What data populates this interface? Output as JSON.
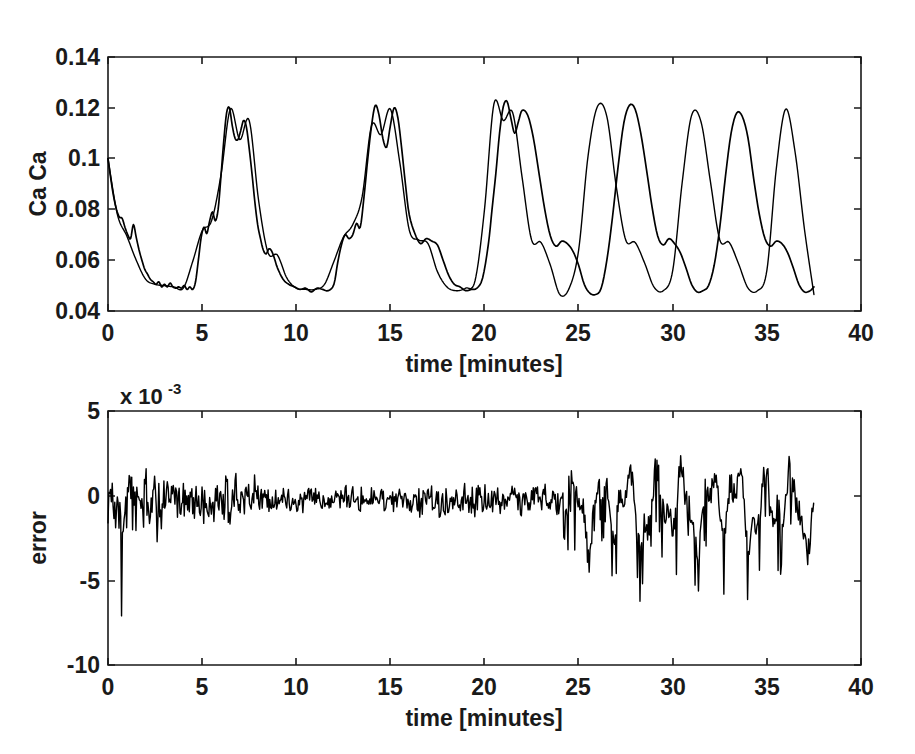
{
  "figure": {
    "background": "#ffffff",
    "line_color": "#000000",
    "axis_color": "#1a1a1a"
  },
  "chart_data": [
    {
      "type": "line",
      "id": "calcium-trace",
      "title": "",
      "xlabel": "time [minutes]",
      "ylabel": "Ca Ca",
      "xlim": [
        0,
        40
      ],
      "ylim": [
        0.04,
        0.14
      ],
      "xticks": [
        0,
        5,
        10,
        15,
        20,
        25,
        30,
        35,
        40
      ],
      "xticklabels": [
        "0",
        "5",
        "10",
        "15",
        "20",
        "25",
        "30",
        "35",
        "40"
      ],
      "yticks": [
        0.04,
        0.06,
        0.08,
        0.1,
        0.12,
        0.14
      ],
      "yticklabels": [
        "0.04",
        "0.06",
        "0.08",
        "0.1",
        "0.12",
        "0.14"
      ],
      "grid": false,
      "legend": false,
      "series": [
        {
          "name": "measured",
          "x": [
            0.0,
            0.15,
            0.3,
            0.45,
            0.6,
            0.75,
            0.9,
            1.05,
            1.2,
            1.35,
            1.5,
            1.65,
            1.8,
            1.95,
            2.1,
            2.25,
            2.4,
            2.55,
            2.7,
            2.85,
            3.0,
            3.15,
            3.3,
            3.45,
            3.6,
            3.75,
            3.9,
            4.05,
            4.2,
            4.35,
            4.5,
            4.65,
            4.8,
            4.95,
            5.1,
            5.25,
            5.4,
            5.55,
            5.7,
            5.85,
            6.0,
            6.15,
            6.3,
            6.45,
            6.6,
            6.75,
            6.9,
            7.05,
            7.2,
            7.35,
            7.5,
            7.65,
            7.8,
            7.95,
            8.1,
            8.25,
            8.4,
            8.55,
            8.7,
            8.85,
            9.0,
            9.3,
            9.6,
            9.9,
            10.2,
            10.5,
            10.8,
            11.1,
            11.4,
            11.7,
            12.0,
            12.2,
            12.4,
            12.6,
            12.8,
            13.0,
            13.2,
            13.4,
            13.6,
            13.8,
            14.0,
            14.2,
            14.4,
            14.6,
            14.8,
            15.0,
            15.2,
            15.4,
            15.6,
            15.8,
            16.0,
            16.3,
            16.6,
            16.9,
            17.2,
            17.5,
            17.8,
            18.1,
            18.4,
            18.7,
            19.0,
            19.3,
            19.6,
            19.9,
            20.2,
            20.4,
            20.6,
            20.8,
            21.0,
            21.2,
            21.4,
            21.6,
            21.8,
            22.0,
            22.3,
            22.6,
            22.9,
            23.2,
            23.5,
            23.8,
            24.1,
            24.4,
            24.7,
            25.0,
            25.3,
            25.6,
            25.9,
            26.2,
            26.5,
            26.8,
            27.1,
            27.4,
            27.7,
            28.0,
            28.3,
            28.6,
            28.9,
            29.2,
            29.5,
            29.8,
            30.1,
            30.4,
            30.7,
            31.0,
            31.3,
            31.6,
            31.9,
            32.2,
            32.5,
            32.8,
            33.1,
            33.4,
            33.7,
            34.0,
            34.3,
            34.6,
            34.9,
            35.2,
            35.5,
            35.8,
            36.1,
            36.4,
            36.7,
            37.0,
            37.3,
            37.5
          ],
          "y": [
            0.1,
            0.092,
            0.085,
            0.08,
            0.077,
            0.0765,
            0.073,
            0.07,
            0.0685,
            0.074,
            0.069,
            0.064,
            0.06,
            0.0565,
            0.0545,
            0.0525,
            0.0515,
            0.0505,
            0.0515,
            0.0495,
            0.0505,
            0.0495,
            0.051,
            0.0495,
            0.049,
            0.0495,
            0.049,
            0.05,
            0.0485,
            0.0495,
            0.0485,
            0.0515,
            0.06,
            0.069,
            0.073,
            0.0705,
            0.0755,
            0.079,
            0.0755,
            0.08,
            0.093,
            0.107,
            0.118,
            0.12,
            0.113,
            0.108,
            0.1075,
            0.111,
            0.115,
            0.1125,
            0.104,
            0.094,
            0.083,
            0.074,
            0.0685,
            0.064,
            0.0625,
            0.0645,
            0.0635,
            0.0605,
            0.057,
            0.0525,
            0.0505,
            0.0495,
            0.0485,
            0.049,
            0.0475,
            0.049,
            0.0485,
            0.048,
            0.0505,
            0.059,
            0.066,
            0.07,
            0.0685,
            0.07,
            0.0745,
            0.073,
            0.085,
            0.1,
            0.113,
            0.121,
            0.117,
            0.108,
            0.1045,
            0.113,
            0.12,
            0.116,
            0.104,
            0.09,
            0.078,
            0.0705,
            0.0665,
            0.0685,
            0.0675,
            0.066,
            0.06,
            0.054,
            0.0505,
            0.0495,
            0.048,
            0.0485,
            0.049,
            0.053,
            0.066,
            0.08,
            0.094,
            0.11,
            0.1205,
            0.1225,
            0.116,
            0.11,
            0.1145,
            0.119,
            0.117,
            0.108,
            0.094,
            0.08,
            0.0695,
            0.0655,
            0.0675,
            0.0665,
            0.0635,
            0.058,
            0.0505,
            0.047,
            0.0465,
            0.049,
            0.06,
            0.077,
            0.097,
            0.114,
            0.121,
            0.1195,
            0.11,
            0.096,
            0.081,
            0.0695,
            0.066,
            0.0685,
            0.0665,
            0.063,
            0.057,
            0.0505,
            0.0475,
            0.048,
            0.05,
            0.058,
            0.073,
            0.093,
            0.11,
            0.118,
            0.1165,
            0.108,
            0.092,
            0.078,
            0.0685,
            0.0655,
            0.0675,
            0.0665,
            0.063,
            0.057,
            0.0505,
            0.0475,
            0.048,
            0.0495,
            0.055,
            0.07,
            0.092,
            0.111,
            0.12,
            0.1215,
            0.118,
            0.107,
            0.092,
            0.078,
            0.0685,
            0.0665,
            0.069,
            0.0655,
            0.06,
            0.054,
            0.0495,
            0.0465,
            0.048,
            0.046
          ]
        },
        {
          "name": "model",
          "x": [
            0.0,
            0.5,
            1.0,
            1.5,
            2.0,
            2.5,
            3.0,
            3.5,
            4.0,
            4.5,
            5.0,
            5.5,
            6.0,
            6.5,
            7.0,
            7.5,
            8.0,
            8.5,
            9.0,
            9.5,
            10.0,
            10.5,
            11.0,
            11.5,
            12.0,
            12.5,
            13.0,
            13.5,
            14.0,
            14.5,
            15.0,
            15.5,
            16.0,
            16.5,
            17.0,
            17.5,
            18.0,
            18.5,
            19.0,
            19.5,
            20.0,
            20.5,
            21.0,
            21.5,
            22.0,
            22.5,
            23.0,
            23.5,
            24.0,
            24.5,
            25.0,
            25.5,
            26.0,
            26.5,
            27.0,
            27.5,
            28.0,
            28.5,
            29.0,
            29.5,
            30.0,
            30.5,
            31.0,
            31.5,
            32.0,
            32.5,
            33.0,
            33.5,
            34.0,
            34.5,
            35.0,
            35.5,
            36.0,
            36.5,
            37.0,
            37.5
          ],
          "y": [
            0.1,
            0.078,
            0.0695,
            0.06,
            0.0525,
            0.0505,
            0.05,
            0.0495,
            0.049,
            0.0595,
            0.0715,
            0.0755,
            0.0935,
            0.1195,
            0.1075,
            0.115,
            0.0835,
            0.063,
            0.062,
            0.053,
            0.049,
            0.0485,
            0.0485,
            0.0505,
            0.0595,
            0.069,
            0.074,
            0.085,
            0.113,
            0.1095,
            0.1195,
            0.0985,
            0.072,
            0.068,
            0.0665,
            0.0555,
            0.0495,
            0.048,
            0.049,
            0.052,
            0.08,
            0.1215,
            0.115,
            0.118,
            0.0925,
            0.068,
            0.067,
            0.058,
            0.0465,
            0.049,
            0.064,
            0.101,
            0.1205,
            0.1165,
            0.089,
            0.068,
            0.067,
            0.059,
            0.0495,
            0.048,
            0.056,
            0.0905,
            0.117,
            0.1145,
            0.091,
            0.068,
            0.067,
            0.0585,
            0.049,
            0.048,
            0.056,
            0.096,
            0.1195,
            0.1025,
            0.072,
            0.0465
          ]
        }
      ],
      "notes": "Two nearly overlapping traces (measurement and model) of a calcium oscillation, roughly 7 bursts with a characteristic double-peaked shape, baseline about 0.048 and peaks about 0.118-0.123; record ends at t = 37.5 min."
    },
    {
      "type": "line",
      "id": "error-trace",
      "title": "",
      "xlabel": "time [minutes]",
      "ylabel": "error",
      "y_multiplier_label": "x 10",
      "y_multiplier_exponent": "-3",
      "xlim": [
        0,
        40
      ],
      "ylim": [
        -10,
        5
      ],
      "xticks": [
        0,
        5,
        10,
        15,
        20,
        25,
        30,
        35,
        40
      ],
      "xticklabels": [
        "0",
        "5",
        "10",
        "15",
        "20",
        "25",
        "30",
        "35",
        "40"
      ],
      "yticks": [
        -10,
        -5,
        0,
        5
      ],
      "yticklabels": [
        "-10",
        "-5",
        "0",
        "5"
      ],
      "grid": false,
      "legend": false,
      "series": [
        {
          "name": "error",
          "seed": 1337,
          "noise_low_amplitude": 0.9,
          "noise_high_amplitude": 2.0,
          "transition_time": 24.2,
          "spike": {
            "time": 0.72,
            "value": -7.1
          },
          "notes": "Residual error: dense high-frequency noise of about +/-1.2e-3 for t < 24 min (with one excursion to -7e-3 near t = 0.7 and several to -2e-3 before t = 8), then larger slower oscillations of roughly +2e-3 to -5e-3 after t = 24 min. Mean approximately -0.3e-3."
        }
      ]
    }
  ]
}
